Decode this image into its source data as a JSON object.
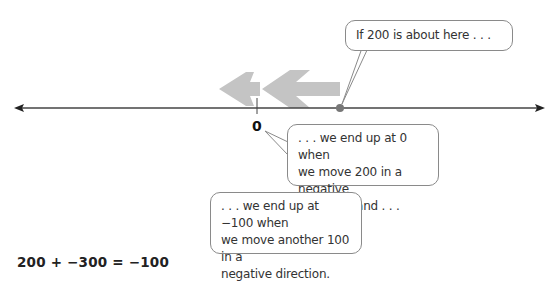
{
  "diagram": {
    "number_line": {
      "zero_label": "0",
      "point_value_label": "200",
      "colors": {
        "line": "#444444",
        "arrows": "#c4c4c4",
        "point": "#777777"
      }
    },
    "bubbles": [
      {
        "id": "bubble-200",
        "text": "If 200 is about here . . ."
      },
      {
        "id": "bubble-zero",
        "line1": ". . . we end up at 0 when",
        "line2": "we move 200 in a negative",
        "line3": "direction, and . . ."
      },
      {
        "id": "bubble-minus100",
        "line1": ". . . we end up at −100 when",
        "line2": "we move another 100 in a",
        "line3": "negative direction."
      }
    ],
    "equation": "200 + −300 = −100"
  }
}
